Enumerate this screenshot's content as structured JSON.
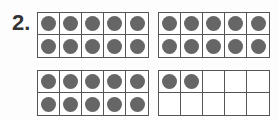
{
  "problem": {
    "number_label": "2.",
    "frames": [
      {
        "filled": 10,
        "capacity": 10
      },
      {
        "filled": 10,
        "capacity": 10
      },
      {
        "filled": 10,
        "capacity": 10
      },
      {
        "filled": 2,
        "capacity": 10
      }
    ],
    "dot_color": "#666666",
    "total": 32
  }
}
